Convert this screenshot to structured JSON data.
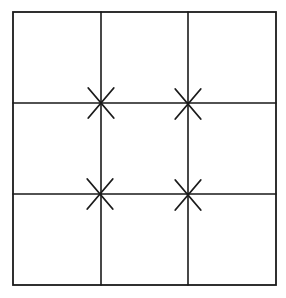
{
  "diagram": {
    "grid": {
      "rows": 3,
      "cols": 3
    },
    "frame": {
      "x1": 13,
      "y1": 12,
      "x2": 276,
      "y2": 285
    },
    "vertical_lines_x": [
      101,
      188
    ],
    "horizontal_lines_y": [
      103,
      194
    ],
    "marks": [
      {
        "cx": 101,
        "cy": 103,
        "shape": "x"
      },
      {
        "cx": 188,
        "cy": 104,
        "shape": "x"
      },
      {
        "cx": 100,
        "cy": 194,
        "shape": "x"
      },
      {
        "cx": 188,
        "cy": 195,
        "shape": "x"
      }
    ],
    "stroke_color": "#1a1a1a"
  }
}
